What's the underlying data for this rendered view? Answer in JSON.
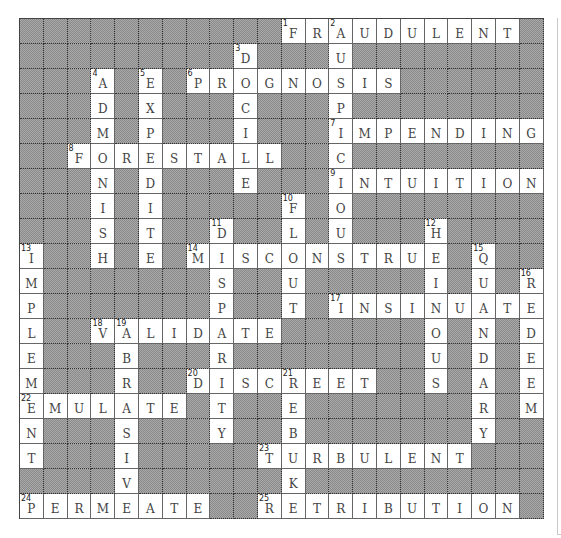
{
  "puzzle": {
    "cols": 22,
    "rows": 20,
    "grid": [
      "###########FRAUDULENT#",
      "#########D###U########",
      "###A#E#PROGNOSIS######",
      "###D#X###C###P########",
      "###M#P###I###IMPENDING",
      "##FORESTALL##C########",
      "###N#D###E###INTUITION",
      "###I#I#####F#O########",
      "###S#T##D##L#U###H####",
      "I##H#E#MISCONSTRUE#Q##",
      "M#######S##U#####I#U#R",
      "P#######P##T#INSINUATE",
      "L##VALIDATE######O#N#D",
      "E###B###R########U#D#E",
      "M###R##DISCREET##S#A#E",
      "EMULATE#T##E#######R#M",
      "N###S###Y##B#######Y##",
      "T###I#####TURBULENT###",
      "####V######K##########",
      "PERMEATE##RETRIBUTION#"
    ],
    "numbers": [
      {
        "n": 1,
        "r": 0,
        "c": 11
      },
      {
        "n": 2,
        "r": 0,
        "c": 13
      },
      {
        "n": 3,
        "r": 1,
        "c": 9
      },
      {
        "n": 4,
        "r": 2,
        "c": 3
      },
      {
        "n": 5,
        "r": 2,
        "c": 5
      },
      {
        "n": 6,
        "r": 2,
        "c": 7
      },
      {
        "n": 7,
        "r": 4,
        "c": 13
      },
      {
        "n": 8,
        "r": 5,
        "c": 2
      },
      {
        "n": 9,
        "r": 6,
        "c": 13
      },
      {
        "n": 10,
        "r": 7,
        "c": 11
      },
      {
        "n": 11,
        "r": 8,
        "c": 8
      },
      {
        "n": 12,
        "r": 8,
        "c": 17
      },
      {
        "n": 13,
        "r": 9,
        "c": 0
      },
      {
        "n": 14,
        "r": 9,
        "c": 7
      },
      {
        "n": 15,
        "r": 9,
        "c": 19
      },
      {
        "n": 16,
        "r": 10,
        "c": 21
      },
      {
        "n": 17,
        "r": 11,
        "c": 13
      },
      {
        "n": 18,
        "r": 12,
        "c": 3
      },
      {
        "n": 19,
        "r": 12,
        "c": 4
      },
      {
        "n": 20,
        "r": 14,
        "c": 7
      },
      {
        "n": 21,
        "r": 14,
        "c": 11
      },
      {
        "n": 22,
        "r": 15,
        "c": 0
      },
      {
        "n": 23,
        "r": 17,
        "c": 10
      },
      {
        "n": 24,
        "r": 19,
        "c": 0
      },
      {
        "n": 25,
        "r": 19,
        "c": 10
      }
    ],
    "across": [
      {
        "n": 1,
        "answer": "FRAUDULENT"
      },
      {
        "n": 6,
        "answer": "PROGNOSIS"
      },
      {
        "n": 7,
        "answer": "IMPENDING"
      },
      {
        "n": 8,
        "answer": "FORESTALL"
      },
      {
        "n": 9,
        "answer": "INTUITION"
      },
      {
        "n": 14,
        "answer": "MISCONSTRUE"
      },
      {
        "n": 17,
        "answer": "INSINUATE"
      },
      {
        "n": 18,
        "answer": "VALIDATE"
      },
      {
        "n": 20,
        "answer": "DISCREET"
      },
      {
        "n": 22,
        "answer": "EMULATE"
      },
      {
        "n": 23,
        "answer": "TURBULENT"
      },
      {
        "n": 24,
        "answer": "PERMEATE"
      },
      {
        "n": 25,
        "answer": "RETRIBUTION"
      }
    ],
    "down": [
      {
        "n": 2,
        "answer": "AUSPICIOUS"
      },
      {
        "n": 3,
        "answer": "DOCILE"
      },
      {
        "n": 4,
        "answer": "ADMONISH"
      },
      {
        "n": 5,
        "answer": "EXPEDITE"
      },
      {
        "n": 10,
        "answer": "FLOUT"
      },
      {
        "n": 11,
        "answer": "DISPARITY"
      },
      {
        "n": 12,
        "answer": "HEINOUS"
      },
      {
        "n": 13,
        "answer": "IMPLEMENT"
      },
      {
        "n": 15,
        "answer": "QUANDARY"
      },
      {
        "n": 16,
        "answer": "REDEEM"
      },
      {
        "n": 19,
        "answer": "ABRASIVE"
      },
      {
        "n": 21,
        "answer": "REBUKE"
      }
    ]
  },
  "colors": {
    "block": "#8a8a8a",
    "open": "#ffffff",
    "letter": "#444444",
    "gridline": "#333333"
  }
}
